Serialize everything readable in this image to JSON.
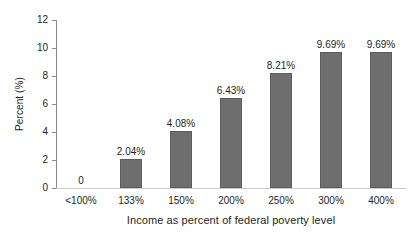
{
  "chart_data": {
    "type": "bar",
    "title": "",
    "xlabel": "Income as percent of federal poverty level",
    "ylabel": "Percent (%)",
    "categories": [
      "<100%",
      "133%",
      "150%",
      "200%",
      "250%",
      "300%",
      "400%"
    ],
    "values": [
      0,
      2.04,
      4.08,
      6.43,
      8.21,
      9.69,
      9.69
    ],
    "value_labels": [
      "0",
      "2.04%",
      "4.08%",
      "6.43%",
      "8.21%",
      "9.69%",
      "9.69%"
    ],
    "ylim": [
      0,
      12
    ],
    "y_ticks": [
      0,
      2,
      4,
      6,
      8,
      10,
      12
    ],
    "y_tick_labels": [
      "0",
      "2",
      "4",
      "6",
      "8",
      "10",
      "12"
    ],
    "grid": false,
    "legend": "none",
    "bar_color": "#6e6e6e",
    "axis_color": "#8a8a8a",
    "text_color": "#231f20"
  }
}
